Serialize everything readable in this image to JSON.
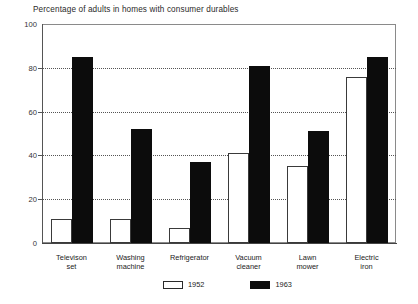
{
  "chart_data": {
    "type": "bar",
    "title": "Percentage of adults in homes with consumer durables",
    "xlabel": "",
    "ylabel": "",
    "ylim": [
      0,
      100
    ],
    "yticks": [
      0,
      20,
      40,
      60,
      80,
      100
    ],
    "ytick_labels": [
      "0",
      "20",
      "40",
      "60",
      "80",
      "100"
    ],
    "grid": true,
    "legend_position": "bottom-center",
    "categories": [
      "Televison\nset",
      "Washing\nmachine",
      "Refrigerator",
      "Vacuum\ncleaner",
      "Lawn\nmower",
      "Electric\niron"
    ],
    "series": [
      {
        "name": "1952",
        "color": "#ffffff",
        "values": [
          11,
          11,
          7,
          41,
          35,
          76
        ]
      },
      {
        "name": "1963",
        "color": "#0c0c0c",
        "values": [
          85,
          52,
          37,
          81,
          51,
          85
        ]
      }
    ]
  },
  "legend": {
    "items": [
      {
        "label": "1952",
        "swatch": "white-square-outline"
      },
      {
        "label": "1963",
        "swatch": "black-filled-square"
      }
    ]
  }
}
